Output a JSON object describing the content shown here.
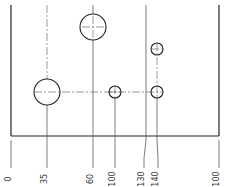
{
  "drawing": {
    "type": "ordinate-dimensioned plate with holes",
    "stroke_color": "#222222",
    "center_line_color": "#555555",
    "ordinate_labels": [
      {
        "value": "0",
        "x": 11
      },
      {
        "value": "35",
        "x": 47
      },
      {
        "value": "60",
        "x": 93
      },
      {
        "value": "100",
        "x": 115
      },
      {
        "value": "130",
        "x": 145
      },
      {
        "value": "140",
        "x": 157
      },
      {
        "value": "100",
        "x": 219
      }
    ],
    "holes": [
      {
        "name": "large-hole-left",
        "cx": 47,
        "cy": 92,
        "r": 13
      },
      {
        "name": "large-hole-top",
        "cx": 93,
        "cy": 27,
        "r": 13
      },
      {
        "name": "small-hole-middle",
        "cx": 115,
        "cy": 92,
        "r": 6
      },
      {
        "name": "small-hole-right-lower",
        "cx": 157,
        "cy": 92,
        "r": 6
      },
      {
        "name": "small-hole-right-upper",
        "cx": 157,
        "cy": 49,
        "r": 6
      }
    ]
  }
}
